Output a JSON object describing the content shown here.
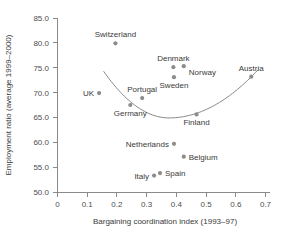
{
  "chart_data": {
    "type": "scatter",
    "title": "",
    "xlabel": "Bargaining coordination index (1993–97)",
    "ylabel": "Employment ratio (average 1999–2000)",
    "xlim": [
      0,
      0.7
    ],
    "ylim": [
      50.0,
      85.0
    ],
    "xticks": [
      "0",
      "0.1",
      "0.2",
      "0.3",
      "0.4",
      "0.5",
      "0.6",
      "0.7"
    ],
    "xtick_values": [
      0,
      0.1,
      0.2,
      0.3,
      0.4,
      0.5,
      0.6,
      0.7
    ],
    "yticks": [
      "50.0",
      "55.0",
      "60.0",
      "65.0",
      "70.0",
      "75.0",
      "80.0",
      "85.0"
    ],
    "ytick_values": [
      50.0,
      55.0,
      60.0,
      65.0,
      70.0,
      75.0,
      80.0,
      85.0
    ],
    "grid": false,
    "legend": "none",
    "point_color": "#8c8c8c",
    "curve_color": "#8a8a8a",
    "axis_color": "#8a8a8a",
    "text_color": "#3a3a3a",
    "points": [
      {
        "label": "Switzerland",
        "x": 0.195,
        "y": 79.9,
        "label_pos": "above"
      },
      {
        "label": "UK",
        "x": 0.14,
        "y": 69.9,
        "label_pos": "left"
      },
      {
        "label": "Germany",
        "x": 0.245,
        "y": 67.5,
        "label_pos": "below"
      },
      {
        "label": "Portugal",
        "x": 0.285,
        "y": 68.9,
        "label_pos": "above"
      },
      {
        "label": "Italy",
        "x": 0.325,
        "y": 53.3,
        "label_pos": "left"
      },
      {
        "label": "Spain",
        "x": 0.345,
        "y": 53.8,
        "label_pos": "right"
      },
      {
        "label": "Denmark",
        "x": 0.39,
        "y": 75.1,
        "label_pos": "above"
      },
      {
        "label": "Sweden",
        "x": 0.392,
        "y": 73.1,
        "label_pos": "below"
      },
      {
        "label": "Netherlands",
        "x": 0.392,
        "y": 59.7,
        "label_pos": "left"
      },
      {
        "label": "Belgium",
        "x": 0.425,
        "y": 57.1,
        "label_pos": "right"
      },
      {
        "label": "Norway",
        "x": 0.425,
        "y": 75.3,
        "label_pos": "below-right"
      },
      {
        "label": "Finland",
        "x": 0.468,
        "y": 65.6,
        "label_pos": "below"
      },
      {
        "label": "Austria",
        "x": 0.652,
        "y": 73.2,
        "label_pos": "above"
      }
    ],
    "fit_curve": {
      "description": "U-shaped quadratic fit",
      "x_start": 0.155,
      "x_end": 0.675,
      "vertex_x": 0.375,
      "vertex_y": 64.9,
      "y_at_start": 74.3,
      "y_at_end": 74.6
    }
  }
}
